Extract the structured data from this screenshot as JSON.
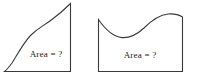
{
  "figure": {
    "canvas": {
      "width": 197,
      "height": 84,
      "background": "#ffffff"
    },
    "stroke_color": "#3a3a3a",
    "text_color": "#222222",
    "shapes": [
      {
        "id": "left-region",
        "name": "sigmoid-area-region",
        "label": "Area = ?",
        "label_x": 46,
        "label_y": 57,
        "path": "M 4.5 71.5 L 70.5 71.5 L 70.5 3.5 C 63 11 57 16 50 21 C 43 26 38 28 31 35 C 24 42 17 55 12 63 C 9 67 6.5 70 4.5 71.5 Z"
      },
      {
        "id": "right-region",
        "name": "wave-area-region",
        "label": "Area = ?",
        "label_x": 140,
        "label_y": 58,
        "path": "M 98.5 19.5 L 98.5 71.5 L 182.5 71.5 L 182.5 17.0 C 179 14.8 174 13.6 168 14.0 C 159 14.8 151 21 144 28 C 137 34.5 130 38.2 122 37.6 C 113 36.8 105 29 98.5 19.5 Z"
      }
    ]
  }
}
